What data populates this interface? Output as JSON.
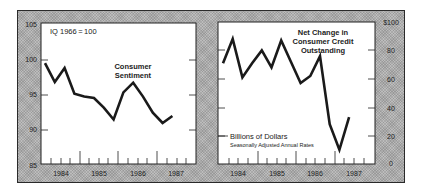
{
  "chart_data": [
    {
      "type": "line",
      "title": "Consumer Sentiment",
      "annotation": "IQ 1966 = 100",
      "xlabel": "",
      "ylabel": "",
      "x_tick_labels": [
        "1984",
        "1985",
        "1986",
        "1987"
      ],
      "y_ticks": [
        85,
        90,
        95,
        100,
        105
      ],
      "y_tick_labels": [
        "85",
        "90",
        "95",
        "100",
        "105"
      ],
      "ylim": [
        85,
        105
      ],
      "y_axis_side": "left",
      "grid": false,
      "x": [
        "1984 Q1",
        "1984 Q2",
        "1984 Q3",
        "1984 Q4",
        "1985 Q1",
        "1985 Q2",
        "1985 Q3",
        "1985 Q4",
        "1986 Q1",
        "1986 Q2",
        "1986 Q3",
        "1986 Q4",
        "1987 Q1",
        "1987 Q2"
      ],
      "series": [
        {
          "name": "Consumer Sentiment",
          "values": [
            99.5,
            96.8,
            98.8,
            95.1,
            94.7,
            94.5,
            93.1,
            91.4,
            95.3,
            96.7,
            94.7,
            92.4,
            90.9,
            91.9
          ]
        }
      ]
    },
    {
      "type": "line",
      "title": "Net Change in Consumer Credit Outstanding",
      "annotation": "Billions of Dollars",
      "subannotation": "Seasonally Adjusted Annual Rates",
      "xlabel": "",
      "ylabel": "",
      "x_tick_labels": [
        "1984",
        "1985",
        "1986",
        "1987"
      ],
      "y_ticks": [
        0,
        20,
        40,
        60,
        80,
        100
      ],
      "y_tick_labels": [
        "0",
        "20",
        "40",
        "60",
        "80",
        "$100"
      ],
      "ylim": [
        0,
        100
      ],
      "y_axis_side": "right",
      "grid": false,
      "x": [
        "1984 Q1",
        "1984 Q2",
        "1984 Q3",
        "1984 Q4",
        "1985 Q1",
        "1985 Q2",
        "1985 Q3",
        "1985 Q4",
        "1986 Q1",
        "1986 Q2",
        "1986 Q3",
        "1986 Q4",
        "1987 Q1",
        "1987 Q2"
      ],
      "series": [
        {
          "name": "Net Change in Consumer Credit Outstanding",
          "values": [
            71,
            88,
            61,
            71,
            80,
            68,
            87,
            72,
            57,
            62,
            76,
            28,
            10,
            33
          ]
        }
      ]
    }
  ],
  "left_chart": {
    "title_line1": "Consumer",
    "title_line2": "Sentiment",
    "annotation": "IQ 1966 = 100",
    "y_labels": [
      "105",
      "100",
      "95",
      "90",
      "85"
    ],
    "x_labels": [
      "1984",
      "1985",
      "1986",
      "1987"
    ]
  },
  "right_chart": {
    "title_line1": "Net Change in",
    "title_line2": "Consumer Credit",
    "title_line3": "Outstanding",
    "unit_label": "Billions of Dollars",
    "unit_sublabel": "Seasonally Adjusted Annual Rates",
    "y_labels": [
      "$100",
      "80",
      "60",
      "40",
      "20",
      "0"
    ],
    "x_labels": [
      "1984",
      "1985",
      "1986",
      "1987"
    ]
  },
  "colors": {
    "line": "#1a1a1a",
    "plot_background": "#ffffff",
    "frame_background": "#bdbdbd"
  }
}
